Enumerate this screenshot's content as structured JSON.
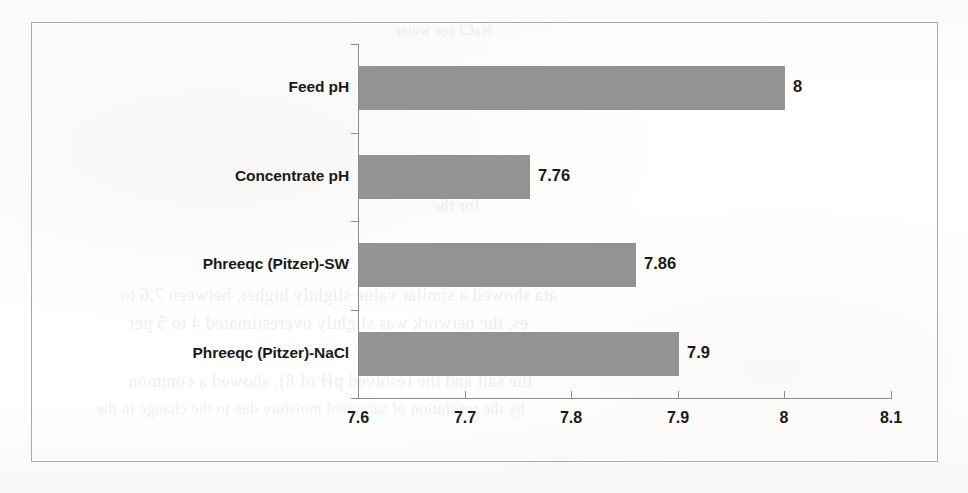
{
  "page": {
    "kind": "scanned-document-page",
    "bleed_through_text": [
      {
        "text": "NaCl see water",
        "x": 395,
        "y": 22,
        "size": 15
      },
      {
        "text": "for the",
        "x": 432,
        "y": 196,
        "size": 17
      },
      {
        "text": "ata showed a similar value slightly higher, between 7.6 to",
        "x": 120,
        "y": 285,
        "size": 18
      },
      {
        "text": "es, the network was slightly overestimated 4 to 5 per",
        "x": 128,
        "y": 313,
        "size": 18
      },
      {
        "text": "the salt and the resolved pH of 8), showed a common",
        "x": 128,
        "y": 371,
        "size": 18
      },
      {
        "text": "by the resolution of saturated moisture due to the change in the",
        "x": 96,
        "y": 400,
        "size": 16
      }
    ]
  },
  "chart_data": {
    "type": "bar",
    "orientation": "horizontal",
    "title": "",
    "xlabel": "",
    "ylabel": "",
    "categories": [
      "Feed pH",
      "Concentrate pH",
      "Phreeqc (Pitzer)-SW",
      "Phreeqc (Pitzer)-NaCl"
    ],
    "values": [
      8,
      7.76,
      7.86,
      7.9
    ],
    "value_labels": [
      "8",
      "7.76",
      "7.86",
      "7.9"
    ],
    "xlim": [
      7.6,
      8.1
    ],
    "xticks": [
      7.6,
      7.7,
      7.8,
      7.9,
      8.0,
      8.1
    ],
    "xtick_labels": [
      "7.6",
      "7.7",
      "7.8",
      "7.9",
      "8",
      "8.1"
    ],
    "grid": false,
    "legend": false,
    "bar_color": "#939393",
    "axis_color": "#8c8c8c",
    "border_color": "#a9a9a9",
    "text_color": "#1a1a1a"
  }
}
